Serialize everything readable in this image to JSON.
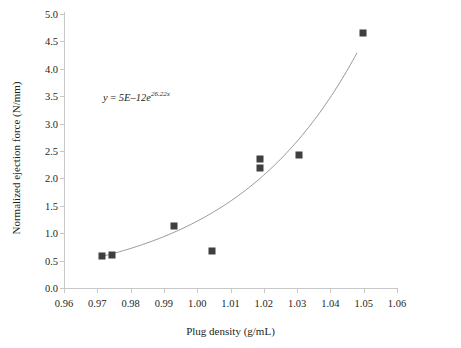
{
  "chart_data": {
    "type": "scatter",
    "title": "",
    "xlabel": "Plug density (g/mL)",
    "ylabel": "Normalized ejection force (N/mm)",
    "xlim": [
      0.96,
      1.06
    ],
    "ylim": [
      0.0,
      5.0
    ],
    "xticks": [
      "0.96",
      "0.97",
      "0.98",
      "0.99",
      "1.00",
      "1.01",
      "1.02",
      "1.03",
      "1.04",
      "1.05",
      "1.06"
    ],
    "xtick_values": [
      0.96,
      0.97,
      0.98,
      0.99,
      1.0,
      1.01,
      1.02,
      1.03,
      1.04,
      1.05,
      1.06
    ],
    "yticks": [
      "0.0",
      "0.5",
      "1.0",
      "1.5",
      "2.0",
      "2.5",
      "3.0",
      "3.5",
      "4.0",
      "4.5",
      "5.0"
    ],
    "ytick_values": [
      0.0,
      0.5,
      1.0,
      1.5,
      2.0,
      2.5,
      3.0,
      3.5,
      4.0,
      4.5,
      5.0
    ],
    "grid": false,
    "legend": false,
    "series": [
      {
        "name": "Normalized ejection force",
        "marker": "square",
        "color": "#3f3f3f",
        "x": [
          0.9715,
          0.9745,
          0.993,
          1.0045,
          1.019,
          1.019,
          1.0305,
          1.0497
        ],
        "y": [
          0.58,
          0.6,
          1.13,
          0.67,
          2.35,
          2.19,
          2.42,
          4.66
        ]
      }
    ],
    "trendline": {
      "type": "exponential",
      "color": "#8c8c8c",
      "coefficient": 5e-12,
      "exponent_rate": 26.22,
      "x_start": 0.9715,
      "x_end": 1.048,
      "equation_parts": {
        "lhs": "y",
        "equals": " = ",
        "coefficient": "5E–12",
        "base": "e",
        "exponent": "26.22x"
      },
      "equation_text": "y = 5E–12e^{26.22x}"
    },
    "colors": {
      "marker": "#3f3f3f",
      "trendline": "#8c8c8c",
      "axis": "#c8c8c8",
      "text": "#231f20",
      "background": "#ffffff"
    }
  }
}
